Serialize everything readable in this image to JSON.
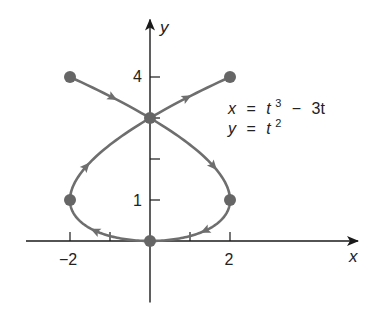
{
  "chart_data": {
    "type": "line",
    "title": "",
    "subtitle": "",
    "xlabel": "x",
    "ylabel": "y",
    "equations": [
      "x = t³ − 3t",
      "y = t²"
    ],
    "equation_parts": {
      "line1": {
        "lhs": "x",
        "eq": "=",
        "t1": "t",
        "sup1": "3",
        "minus": "−",
        "rest": "3t"
      },
      "line2": {
        "lhs": "y",
        "eq": "=",
        "t1": "t",
        "sup1": "2"
      }
    },
    "parametric": {
      "x": "t^3 - 3t",
      "y": "t^2",
      "t_range": [
        -2,
        2
      ]
    },
    "x_tick_labels": [
      "−2",
      "2"
    ],
    "x_tick_label_values": [
      -2,
      2
    ],
    "x_ticks": [
      -2,
      -1,
      1,
      2
    ],
    "y_tick_labels": [
      "1",
      "4"
    ],
    "y_tick_label_values": [
      1,
      4
    ],
    "y_ticks": [
      1,
      2,
      3,
      4
    ],
    "xlim": [
      -3.1,
      5.2
    ],
    "ylim": [
      -1.5,
      5.4
    ],
    "grid": false,
    "legend": null,
    "marked_points": [
      {
        "t": -2,
        "x": -2,
        "y": 4
      },
      {
        "t": 2,
        "x": 2,
        "y": 4
      },
      {
        "t": -1.732,
        "x": 0,
        "y": 3
      },
      {
        "t": -1,
        "x": 2,
        "y": 1
      },
      {
        "t": 1,
        "x": -2,
        "y": 1
      },
      {
        "t": 0,
        "x": 0,
        "y": 0
      }
    ],
    "direction_arrows_t": [
      -1.87,
      -1.35,
      -0.5,
      0.5,
      1.35,
      1.87
    ],
    "curve_color": "#6e6e6e",
    "point_color": "#666666",
    "axis_color": "#1a1a1a"
  }
}
